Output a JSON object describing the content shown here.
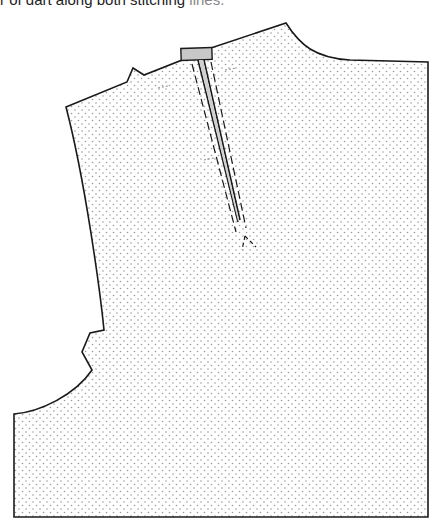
{
  "caption": {
    "text_dark": "r of dart along both stitching",
    "text_light": " lines."
  },
  "diagram": {
    "type": "sewing-pattern-piece",
    "fill_pattern": "stippled-dots",
    "colors": {
      "outline": "#1a1a1a",
      "fill_dots": "#9a9a9a",
      "tab_fill": "#c8c8c8",
      "background": "#ffffff"
    },
    "elements": [
      {
        "name": "pattern-outline",
        "description": "Bodice piece with shoulder, neckline, side, armhole notches, waist"
      },
      {
        "name": "dart-fold",
        "description": "Folded dart shown as solid line from shoulder to point"
      },
      {
        "name": "stitching-lines",
        "description": "Two dashed stitching lines flanking the dart"
      },
      {
        "name": "dart-tab",
        "description": "Grey rectangular tab where dart meets shoulder seam"
      },
      {
        "name": "dart-point",
        "description": "Dashed lines converging at dart tip"
      }
    ]
  }
}
